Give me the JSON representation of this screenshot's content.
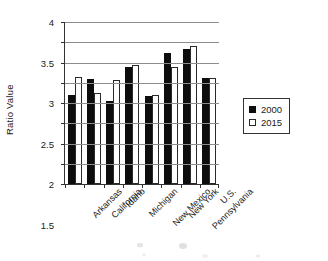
{
  "chart_data": {
    "type": "bar",
    "title": "",
    "xlabel": "",
    "ylabel": "Ratio Value",
    "ylim": [
      0,
      4
    ],
    "ytick_step": 0.5,
    "yticks": [
      "4",
      "3.5",
      "3",
      "2.5",
      "2",
      "1.5",
      "1",
      "0.5",
      "0"
    ],
    "ytick_values": [
      4,
      3.5,
      3,
      2.5,
      2,
      1.5,
      1,
      0.5,
      0
    ],
    "grid": "horizontal",
    "legend_position": "right",
    "categories": [
      "Arkansas",
      "California",
      "Idaho",
      "Michigan",
      "New Mexico",
      "New York",
      "Pennsylvania",
      "U.S."
    ],
    "series": [
      {
        "name": "2000",
        "color": "#0d0d0d",
        "values": [
          2.2,
          2.6,
          2.06,
          2.88,
          2.17,
          3.24,
          3.34,
          2.62
        ]
      },
      {
        "name": "2015",
        "color": "#ffffff",
        "values": [
          2.64,
          2.24,
          2.57,
          2.95,
          2.21,
          2.9,
          3.42,
          2.61
        ]
      }
    ]
  },
  "legend": {
    "items": [
      {
        "label": "2000",
        "swatch": "filled-black-square"
      },
      {
        "label": "2015",
        "swatch": "outlined-white-square"
      }
    ]
  },
  "colors": {
    "series_2000": "#0d0d0d",
    "series_2015": "#ffffff",
    "axis": "#333333",
    "gridline": "#8c8c8c",
    "background": "#ffffff"
  }
}
